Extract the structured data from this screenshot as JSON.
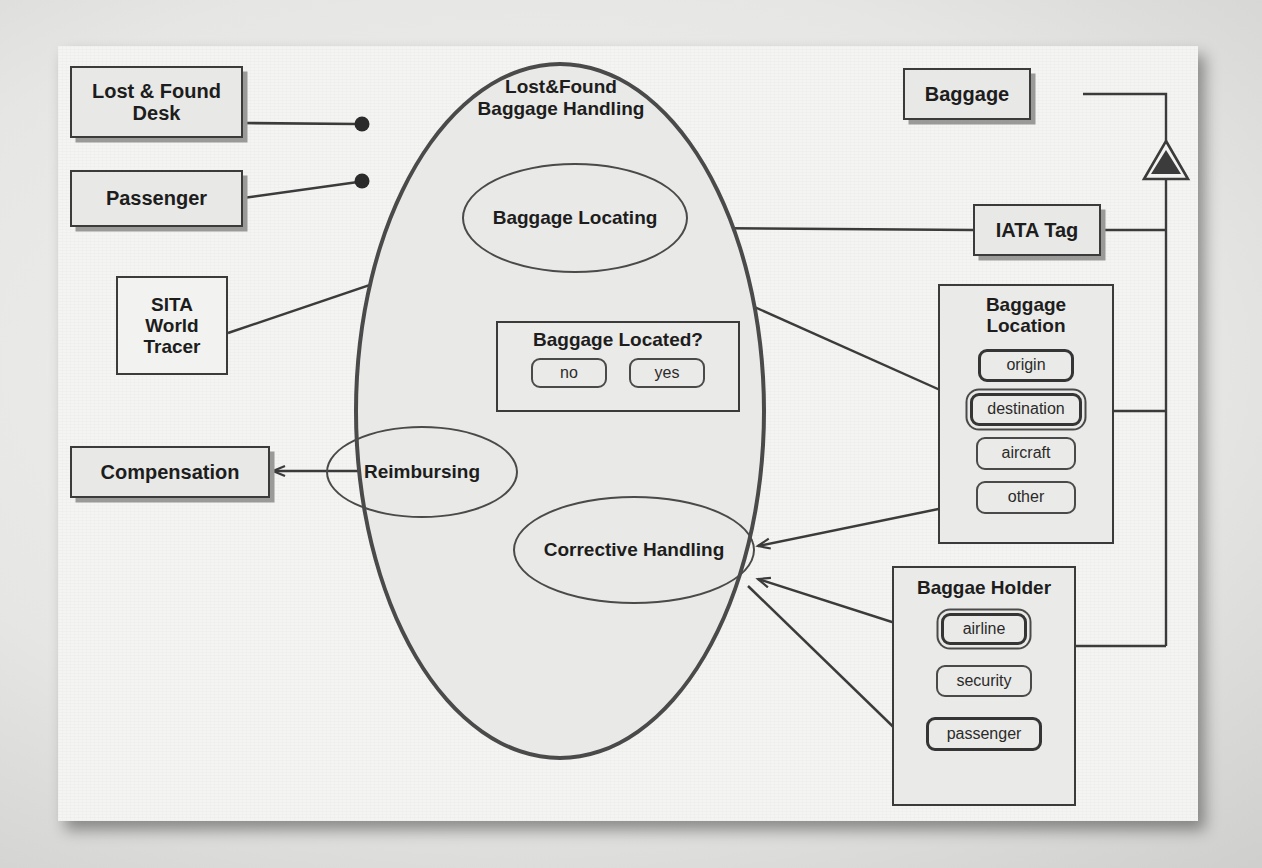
{
  "diagram": {
    "kind": "uml-use-case-diagram",
    "system_boundary_title_line1": "Lost&Found",
    "system_boundary_title_line2": "Baggage Handling",
    "ink_color": "#3b3b3b",
    "box_fill": "#e8e8e6",
    "paper_color": "#f4f4f2"
  },
  "actors": {
    "lost_found_desk": "Lost & Found\nDesk",
    "lost_found_desk_line1": "Lost & Found",
    "lost_found_desk_line2": "Desk",
    "passenger": "Passenger",
    "sita_line1": "SITA",
    "sita_line2": "World",
    "sita_line3": "Tracer",
    "compensation": "Compensation"
  },
  "usecases": {
    "baggage_locating": "Baggage Locating",
    "reimbursing": "Reimbursing",
    "corrective_handling": "Corrective Handling"
  },
  "decision": {
    "title": "Baggage Located?",
    "options": [
      {
        "label": "no",
        "selected": false
      },
      {
        "label": "yes",
        "selected": false
      }
    ]
  },
  "classes": {
    "baggage": "Baggage",
    "iata_tag": "IATA Tag",
    "baggage_location": {
      "title_line1": "Baggage",
      "title_line2": "Location",
      "items": [
        {
          "label": "origin",
          "style": "bold"
        },
        {
          "label": "destination",
          "style": "selected"
        },
        {
          "label": "aircraft",
          "style": "plain"
        },
        {
          "label": "other",
          "style": "plain"
        }
      ]
    },
    "baggage_holder": {
      "title": "Baggae Holder",
      "items": [
        {
          "label": "airline",
          "style": "selected"
        },
        {
          "label": "security",
          "style": "plain"
        },
        {
          "label": "passenger",
          "style": "bold"
        }
      ]
    }
  },
  "connectors": {
    "provided_interface": "open-circle",
    "required_interface": "socket-circle",
    "association_end": "filled-dot",
    "generalization": "hollow-triangle"
  }
}
